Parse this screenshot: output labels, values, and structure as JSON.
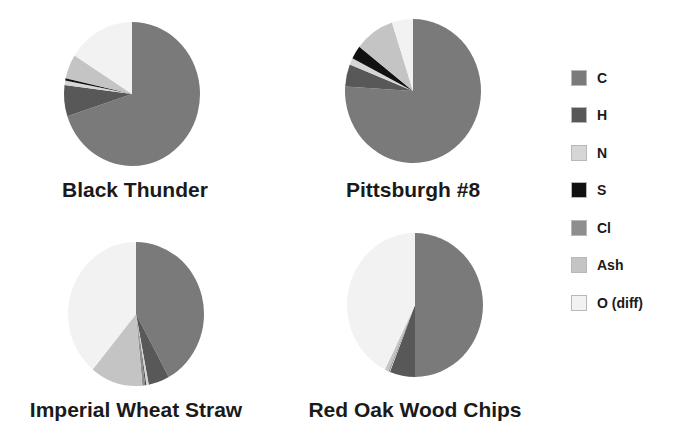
{
  "chart_data": {
    "type": "pie",
    "legend_position": "right",
    "categories": [
      "C",
      "H",
      "N",
      "S",
      "Cl",
      "Ash",
      "O (diff)"
    ],
    "colors": [
      "#7a7a7a",
      "#585858",
      "#d6d6d6",
      "#111111",
      "#8e8e8e",
      "#c4c4c4",
      "#f2f2f2"
    ],
    "charts": [
      {
        "title": "Black Thunder",
        "values": [
          70.0,
          7.0,
          1.0,
          0.5,
          0.1,
          5.4,
          16.0
        ]
      },
      {
        "title": "Pittsburgh #8",
        "values": [
          76.0,
          5.0,
          1.5,
          3.0,
          0.1,
          9.4,
          5.0
        ]
      },
      {
        "title": "Imperial Wheat Straw",
        "values": [
          42.0,
          5.0,
          0.6,
          0.2,
          0.7,
          12.5,
          39.0
        ]
      },
      {
        "title": "Red Oak Wood Chips",
        "values": [
          50.0,
          6.0,
          0.2,
          0.1,
          0.1,
          0.9,
          42.7
        ]
      }
    ]
  },
  "legend": {
    "items": [
      {
        "label": "C",
        "color": "#7a7a7a"
      },
      {
        "label": "H",
        "color": "#585858"
      },
      {
        "label": "N",
        "color": "#d6d6d6"
      },
      {
        "label": "S",
        "color": "#111111"
      },
      {
        "label": "Cl",
        "color": "#8e8e8e"
      },
      {
        "label": "Ash",
        "color": "#c4c4c4"
      },
      {
        "label": "O (diff)",
        "color": "#f2f2f2"
      }
    ]
  },
  "titles": {
    "black_thunder": "Black Thunder",
    "pittsburgh": "Pittsburgh #8",
    "wheat_straw": "Imperial Wheat Straw",
    "red_oak": "Red Oak Wood Chips"
  }
}
